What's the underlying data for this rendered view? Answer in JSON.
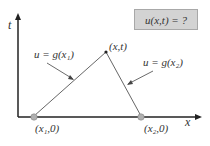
{
  "diagram": {
    "question_box": "u(x,t) = ?",
    "axis_t": "t",
    "axis_x": "x",
    "apex_label": "(x,t)",
    "left_line_label": "u = g(x₁)",
    "right_line_label": "u = g(x₂)",
    "point1_label": "(x₁,0)",
    "point2_label": "(x₂,0)",
    "colors": {
      "axis": "#222222",
      "line": "#555555",
      "point": "#aaaaaa",
      "box": "#d3d3d3"
    }
  }
}
